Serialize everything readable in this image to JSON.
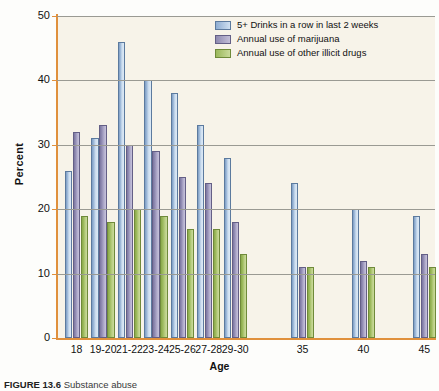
{
  "figure": {
    "caption_label": "FIGURE 13.6",
    "caption_text": "Substance abuse"
  },
  "chart_data": {
    "type": "bar",
    "title": "",
    "xlabel": "Age",
    "ylabel": "Percent",
    "ylim": [
      0,
      50
    ],
    "yticks": [
      0,
      10,
      20,
      30,
      40,
      50
    ],
    "grid": true,
    "legend_position": "top-right",
    "categories": [
      "18",
      "19-20",
      "21-22",
      "23-24",
      "25-26",
      "27-28",
      "29-30",
      "35",
      "40",
      "45"
    ],
    "series": [
      {
        "name": "5+ Drinks in a row in last 2 weeks",
        "color": "#9db8d8",
        "values": [
          26,
          31,
          46,
          40,
          38,
          33,
          28,
          24,
          20,
          19
        ]
      },
      {
        "name": "Annual use of marijuana",
        "color": "#918cb3",
        "values": [
          32,
          33,
          30,
          29,
          25,
          24,
          18,
          11,
          12,
          13
        ]
      },
      {
        "name": "Annual use of other illicit drugs",
        "color": "#9cb95c",
        "values": [
          19,
          18,
          20,
          19,
          17,
          17,
          13,
          11,
          11,
          11
        ]
      }
    ]
  },
  "axis": {
    "accent_color": "#e0903c",
    "plot_background": "#f7f3e9",
    "gridline_color": "#9a9a93"
  }
}
